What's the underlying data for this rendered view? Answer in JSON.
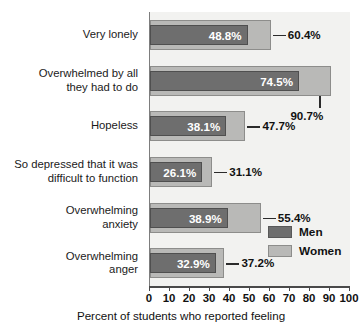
{
  "chart_data": {
    "type": "bar",
    "orientation": "horizontal",
    "title": "",
    "xlabel": "Percent of students who reported feeling",
    "ylabel": "",
    "xlim": [
      0,
      100
    ],
    "xticks": [
      "0",
      "10",
      "20",
      "30",
      "40",
      "50",
      "60",
      "70",
      "80",
      "90",
      "100"
    ],
    "grid": false,
    "legend_position": "inside-bottom-right",
    "categories": [
      "Very lonely",
      "Overwhelmed by all\nthey had to do",
      "Hopeless",
      "So depressed that it was\ndifficult to function",
      "Overwhelming\nanxiety",
      "Overwhelming\nanger"
    ],
    "series": [
      {
        "name": "Men",
        "color": "#6e6e6e",
        "values": [
          48.8,
          74.5,
          38.1,
          26.1,
          38.9,
          32.9
        ],
        "labels": [
          "48.8%",
          "74.5%",
          "38.1%",
          "26.1%",
          "38.9%",
          "32.9%"
        ]
      },
      {
        "name": "Women",
        "color": "#b9b9b7",
        "values": [
          60.4,
          90.7,
          47.7,
          31.1,
          55.4,
          37.2
        ],
        "labels": [
          "60.4%",
          "90.7%",
          "47.7%",
          "31.1%",
          "55.4%",
          "37.2%"
        ]
      }
    ]
  },
  "legend": {
    "items": [
      {
        "label": "Men",
        "color": "#6e6e6e"
      },
      {
        "label": "Women",
        "color": "#b9b9b7"
      }
    ]
  },
  "axis": {
    "x_title": "Percent of students who reported feeling"
  },
  "top_sliver_text": ""
}
